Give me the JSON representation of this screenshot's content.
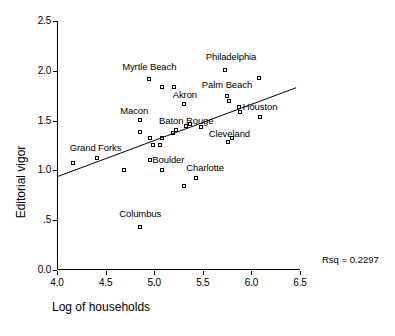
{
  "chart_data": {
    "type": "scatter",
    "title": "",
    "xlabel": "Log of households",
    "ylabel": "Editorial vigor",
    "xlim": [
      4.0,
      6.5
    ],
    "ylim": [
      0.0,
      2.5
    ],
    "xticks": [
      "4.0",
      "4.5",
      "5.0",
      "5.5",
      "6.0",
      "6.5"
    ],
    "xtick_values": [
      4.0,
      4.5,
      5.0,
      5.5,
      6.0,
      6.5
    ],
    "yticks": [
      "0.0",
      ".5",
      "1.0",
      "1.5",
      "2.0",
      "2.5"
    ],
    "ytick_values": [
      0.0,
      0.5,
      1.0,
      1.5,
      2.0,
      2.5
    ],
    "grid": false,
    "legend": "none",
    "annotation": "Rsq = 0.2297",
    "rsq": 0.2297,
    "marker_style": "open-square",
    "fit_line": {
      "type": "linear",
      "x_start": 4.0,
      "y_start": 0.94,
      "x_end": 6.45,
      "y_end": 1.83
    },
    "points": [
      {
        "x": 4.16,
        "y": 1.07,
        "label": ""
      },
      {
        "x": 4.41,
        "y": 1.12,
        "label": "Grand Forks"
      },
      {
        "x": 4.68,
        "y": 1.0,
        "label": ""
      },
      {
        "x": 4.85,
        "y": 1.5,
        "label": "Macon"
      },
      {
        "x": 4.85,
        "y": 1.38,
        "label": ""
      },
      {
        "x": 4.85,
        "y": 0.43,
        "label": "Columbus"
      },
      {
        "x": 4.94,
        "y": 1.91,
        "label": "Myrtle Beach"
      },
      {
        "x": 4.95,
        "y": 1.32,
        "label": ""
      },
      {
        "x": 4.95,
        "y": 1.1,
        "label": "Boulder"
      },
      {
        "x": 4.98,
        "y": 1.25,
        "label": ""
      },
      {
        "x": 5.05,
        "y": 1.25,
        "label": ""
      },
      {
        "x": 5.08,
        "y": 1.83,
        "label": ""
      },
      {
        "x": 5.08,
        "y": 1.32,
        "label": ""
      },
      {
        "x": 5.08,
        "y": 1.0,
        "label": ""
      },
      {
        "x": 5.2,
        "y": 1.83,
        "label": ""
      },
      {
        "x": 5.19,
        "y": 1.37,
        "label": ""
      },
      {
        "x": 5.22,
        "y": 1.4,
        "label": "Baton Rouge"
      },
      {
        "x": 5.3,
        "y": 1.66,
        "label": "Akron"
      },
      {
        "x": 5.3,
        "y": 0.84,
        "label": ""
      },
      {
        "x": 5.32,
        "y": 1.44,
        "label": ""
      },
      {
        "x": 5.36,
        "y": 1.46,
        "label": ""
      },
      {
        "x": 5.42,
        "y": 0.92,
        "label": "Charlotte"
      },
      {
        "x": 5.48,
        "y": 1.43,
        "label": ""
      },
      {
        "x": 5.72,
        "y": 2.0,
        "label": "Philadelphia"
      },
      {
        "x": 5.74,
        "y": 1.74,
        "label": "Palm Beach"
      },
      {
        "x": 5.75,
        "y": 1.28,
        "label": "Cleveland"
      },
      {
        "x": 5.76,
        "y": 1.69,
        "label": ""
      },
      {
        "x": 5.8,
        "y": 1.32,
        "label": ""
      },
      {
        "x": 5.87,
        "y": 1.63,
        "label": "Houston"
      },
      {
        "x": 5.88,
        "y": 1.58,
        "label": ""
      },
      {
        "x": 6.07,
        "y": 1.92,
        "label": ""
      },
      {
        "x": 6.08,
        "y": 1.53,
        "label": ""
      }
    ],
    "point_labels": [
      {
        "text": "Myrtle Beach",
        "x": 4.66,
        "y": 2.04
      },
      {
        "text": "Philadelphia",
        "x": 5.52,
        "y": 2.14
      },
      {
        "text": "Palm Beach",
        "x": 5.48,
        "y": 1.86
      },
      {
        "text": "Akron",
        "x": 5.18,
        "y": 1.76
      },
      {
        "text": "Houston",
        "x": 5.9,
        "y": 1.64
      },
      {
        "text": "Macon",
        "x": 4.64,
        "y": 1.6
      },
      {
        "text": "Baton Rouge",
        "x": 5.04,
        "y": 1.5
      },
      {
        "text": "Cleveland",
        "x": 5.55,
        "y": 1.37
      },
      {
        "text": "Grand Forks",
        "x": 4.12,
        "y": 1.22
      },
      {
        "text": "Boulder",
        "x": 4.97,
        "y": 1.1
      },
      {
        "text": "Charlotte",
        "x": 5.32,
        "y": 1.02
      },
      {
        "text": "Columbus",
        "x": 4.63,
        "y": 0.56
      }
    ]
  }
}
